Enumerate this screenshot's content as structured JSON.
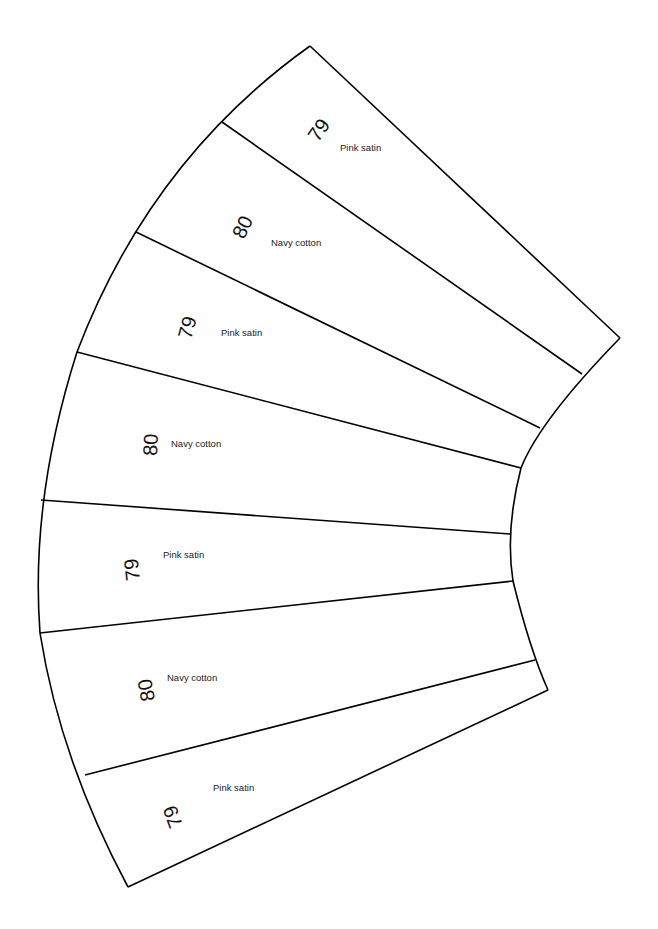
{
  "diagram": {
    "type": "fan-quilt-pattern",
    "segments": [
      {
        "number": "79",
        "fabric": "Pink satin"
      },
      {
        "number": "80",
        "fabric": "Navy cotton"
      },
      {
        "number": "79",
        "fabric": "Pink satin"
      },
      {
        "number": "80",
        "fabric": "Navy cotton"
      },
      {
        "number": "79",
        "fabric": "Pink satin"
      },
      {
        "number": "80",
        "fabric": "Navy cotton"
      },
      {
        "number": "79",
        "fabric": "Pink satin"
      }
    ],
    "colors": {
      "line": "#000000",
      "background": "#ffffff"
    }
  }
}
